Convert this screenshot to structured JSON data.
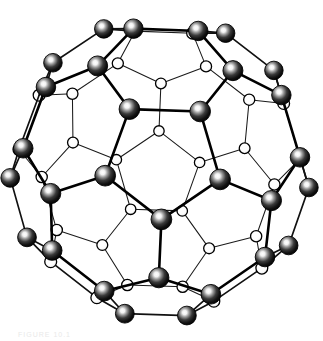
{
  "figure": {
    "view": "five-fold axis projection",
    "background_color": "#ffffff",
    "caption_remnant": "FIGURE 10.1"
  },
  "legend": {
    "front_atom_label": "front carbon atom",
    "back_atom_label": "back carbon atom",
    "bond_label": "carbon-carbon bond"
  },
  "style": {
    "dark_atom_color": "#111111",
    "dark_atom_highlight": "#ffffff",
    "light_atom_color": "#ffffff",
    "bond_color": "#000000",
    "outline_color": "#000000"
  },
  "structure": {
    "name": "truncated icosahedron",
    "atom_count": 60,
    "bond_count": 90,
    "pentagon_count": 12,
    "hexagon_count": 20,
    "element": "C",
    "atom_radius_front": 9,
    "atom_radius_back": 6
  },
  "chart_data": {
    "type": "graph",
    "node_count": 60,
    "edge_count": 90,
    "projection": {
      "center_x": 160,
      "center_y": 168,
      "radius": 148,
      "rotation_deg": 0,
      "tilt_deg": 0
    }
  }
}
